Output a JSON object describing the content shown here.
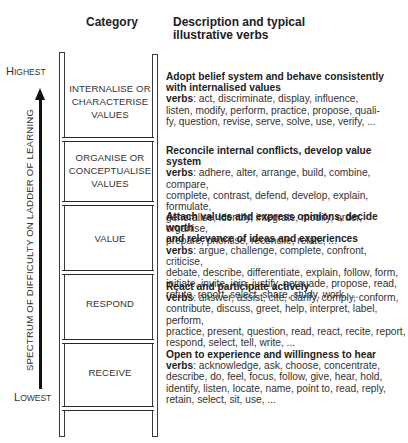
{
  "headers": {
    "category": "Category",
    "description_line1": "Description and typical",
    "description_line2": "illustrative verbs"
  },
  "axis": {
    "top_label_first": "H",
    "top_label_rest": "IGHEST",
    "bottom_label_first": "L",
    "bottom_label_rest": "OWEST",
    "vertical_label": "SPECTRUM OF DIFFICULTY ON LADDER OF LEARNING",
    "arrow_icon": "arrow-up"
  },
  "levels": [
    {
      "category_lines": [
        "INTERNALISE OR",
        "CHARACTERISE",
        "VALUES"
      ],
      "title_lines": [
        "Adopt belief system and behave consistently",
        "with internalised values"
      ],
      "verbs_label": "verbs",
      "verbs_lines": [
        ": act, discriminate, display, influence,",
        "listen, modify, perform, practice, propose, quali-",
        "fy, question, revise, serve, solve, use, verify, ..."
      ]
    },
    {
      "category_lines": [
        "ORGANISE OR",
        "CONCEPTUALISE",
        "VALUES"
      ],
      "title_lines": [
        "Reconcile internal conflicts, develop value system"
      ],
      "verbs_label": "verbs",
      "verbs_lines": [
        ": adhere, alter, arrange, build, combine, compare,",
        "complete, contrast, defend, develop, explain, formulate,",
        "generalise, identify, integrate, modify, order, organise,",
        "prepare, prioritise, reconcile, relate, ..."
      ]
    },
    {
      "category_lines": [
        "VALUE"
      ],
      "title_lines": [
        "Attach values and express opinions, decide worth",
        "and relevance of ideas and experiences"
      ],
      "verbs_label": "verbs",
      "verbs_lines": [
        ": argue, challenge, complete, confront, criticise,",
        "debate, describe, differentiate, explain, follow, form,",
        "initiate, invite, join, justify, persuade, propose, read,",
        "refute, report, select, share, study, work, ..."
      ]
    },
    {
      "category_lines": [
        "RESPOND"
      ],
      "title_lines": [
        "React and participate actively"
      ],
      "verbs_label": "verbs",
      "verbs_lines": [
        ": answer, assist, cite, clarify, comply, conform,",
        "contribute, discuss, greet, help, interpret, label, perform,",
        "practice, present, question, read, react, recite, report,",
        "respond, select, tell, write, ..."
      ]
    },
    {
      "category_lines": [
        "RECEIVE"
      ],
      "title_lines": [
        "Open to experience and willingness to hear"
      ],
      "verbs_label": "verbs",
      "verbs_lines": [
        ": acknowledge, ask, choose, concentrate,",
        "describe, do, feel, focus, follow, give, hear, hold,",
        "identify, listen, locate, name, point to, read, reply,",
        "retain, select, sit, use, ..."
      ]
    }
  ]
}
